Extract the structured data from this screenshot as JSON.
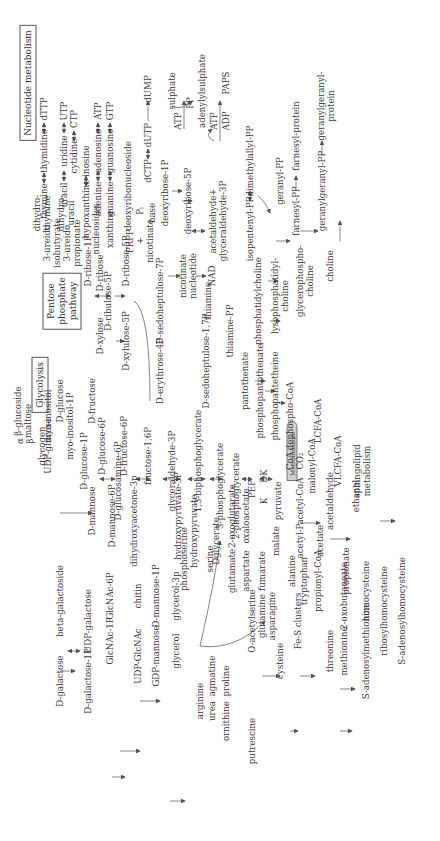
{
  "figure": {
    "orientation": "rotated-90-ccw",
    "section_titles": {
      "nucleotide": "Nucleotide metabolism",
      "pentose": "Pentose\nphosphate\npathway",
      "glycolysis": "Glycolysis"
    },
    "drug_label": "Metronidazole",
    "nodes": {
      "thymine": "thymine",
      "thymidine": "thymidine",
      "dTTP": "dTTP",
      "uracil": "uracil",
      "uridine": "uridine",
      "UTP": "UTP",
      "cytidine": "cytidine",
      "CTP": "CTP",
      "hypoxanthine": "hypoxanthine",
      "inosine": "inosine",
      "adenine": "adenine",
      "adenosine": "adenosine",
      "ATP1": "ATP",
      "guanine": "guanine",
      "guanosine": "guanosine",
      "GTP": "GTP",
      "deoxyribonucleoside": "deoxyribonucleoside",
      "dCTP": "dCTP",
      "dUTP": "dUTP",
      "dUMP": "dUMP",
      "sulphate": "sulphate",
      "ATP2": "ATP",
      "PP": "PP",
      "adenylylsulphate": "adenylylsulphate",
      "ATP3": "ATP",
      "ADP": "ADP",
      "PAPS": "PAPS",
      "Pi": "Pᵢ",
      "base": "base",
      "deoxyribose1P": "deoxyribose-1P",
      "deoxyribose5P": "deoxyribose-5P",
      "acetaldehyde_g3p": "acetaldehyde+\nglyceraldehyde-3P",
      "isopentenylPP": "isopentenyl-PP",
      "dimethylallylPP": "dimethylallyl-PP",
      "geranylPP": "geranyl-PP",
      "farnesylPP": "farnesyl-PP",
      "farnesylprotein": "farnesyl-protein",
      "geranylgeranylPP": "geranylgeranyl-PP",
      "geranylgeranylprotein": "geranylgeranyl-\nprotein",
      "ureidoisobutyrate": "3-ureido\nisobutyrate",
      "dihydrothymine": "dihydro-\nthymine",
      "ureidopropionate": "3-ureido\npropionate",
      "dihydrouracil": "dihydro-\nuracil",
      "nucleosides": "nucleosides",
      "xanthine": "xanthine",
      "PRPP_nicotinate": "PRPP\n+\nnicotinate",
      "nicotinate_nucleotide": "nicotinate\nnucleotide",
      "NAD": "NAD",
      "Dribose1P": "D-ribose-1P",
      "Dribose": "D-ribose",
      "Dribose5P": "D-ribose-5P",
      "Dribulose5P": "D-ribulose-5P",
      "Dxylose": "D-xylose",
      "Dxylulose5P": "D-xylulose-5P",
      "sedoheptulose7P": "D-sedoheptulose-7P",
      "erythrose4P": "D-erythrose-4P",
      "sedoheptulose17P": "D-sedoheptulose-1,7P",
      "thiamine": "thiamine",
      "thiaminePP": "thiamine-PP",
      "phosphatidylcholine": "phosphatidylcholine",
      "lysophosphatidylcholine": "lysophosphatidyl-\ncholine",
      "glycerophosphocholine": "glycerophospho-\ncholine",
      "choline": "choline",
      "pantothenate": "pantothenate",
      "phosphopantothenate": "phosphopantothenate",
      "phosphopantetheine": "phosphopantetheine",
      "dephosphoCoA": "dephospho-CoA",
      "CoA": "CoA",
      "CO2": "CO₂",
      "malonylCoA": "malonyl-CoA",
      "LCFACoA": "LCFA-CoA",
      "VLCFACoA": "VLCFA-CoA",
      "sphingolipid": "sphingolipid\nmetabolism",
      "beta_glucoside": "β-glucoside",
      "maltose": "maltose",
      "alpha": "α",
      "beta": "β",
      "glycogen": "glycogen",
      "Dglucose": "D-glucose",
      "myoinositol": "myo-inositol",
      "myoinositol1P": "myo-inositol-1P",
      "Dfructose": "D-fructose",
      "Dglucose6P": "D-glucose-6P",
      "Dfructose6P": "D-fructose-6P",
      "fructose16P": "fructose-1,6P",
      "glyceraldehyde3P": "glyceraldehyde-3P",
      "biphosphoglycerate": "1,3-biphosphoglycerate",
      "phosphoglycerate3": "3-phosphoglycerate",
      "phosphoglycerate2": "2-phosphoglycerate",
      "PEP": "PEP",
      "K": "K",
      "DK": "DK",
      "pyruvate": "pyruvate",
      "acetylCoA": "acetyl-CoA",
      "acetaldehyde": "acetaldehyde",
      "ethanol": "ethanol",
      "UDPglucose": "UDP-glucose",
      "Dglucose1P": "D-glucose-1P",
      "Dglucosamine6P": "D-glucosamine-6P",
      "Dmannose": "D-mannose",
      "Dmannose6P": "D-mannose-6P",
      "dihydroxyacetone3p": "dihydroxyacetone-3p",
      "hydroxypyruvate3P": "hydroxypyruvate-3P",
      "hydroxypyruvate": "hydroxypyruvate",
      "Dglycerate": "Dglycerate",
      "oxoglutarate": "2-oxoglutarate",
      "oxaloacetate": "oxaloacetate",
      "phosphoserine": "phosphoserine",
      "serine": "serine",
      "glutamate": "glutamate",
      "aspartate": "aspartate",
      "fumarate": "fumarate",
      "malate": "malate",
      "acetylP": "acetyl-P",
      "acetate": "acetate",
      "propionylCoA": "propionyl-CoA",
      "propionate": "propionate",
      "Dgalactose": "D-galactose",
      "betagalactoside": "beta-galactoside",
      "Dgalactose1P": "D-galactose-1P",
      "UDPgalactose": "UDP-galactose",
      "GlcNAc1P": "GlcNAc-1P",
      "GlcNAc6P": "GlcNAc-6P",
      "UDPGlcNAc": "UDP-GlcNAc",
      "chitin": "chitin",
      "GDPmannose": "GDP-mannose",
      "Dmannose1P": "D-mannose-1P",
      "glycerol": "glycerol",
      "glycerol3p": "glycerol-3p",
      "arginine": "arginine",
      "agmatine": "agmatine",
      "urea": "urea",
      "ornithine": "ornithine",
      "proline": "proline",
      "putrescine": "putrescine",
      "Oacetylserine": "O-acetylserine",
      "glutamine": "glutamine",
      "asparagine": "asparagine",
      "cysteine": "cysteine",
      "FeS": "Fe-S clusters",
      "alanine": "alanine",
      "tryptophan": "tryptophan",
      "threonine": "threonine",
      "methionine": "methionine",
      "oxobutanoate": "2-oxobutanoate",
      "SAM": "S-adenosylmethionine",
      "homocysteine": "homocysteine",
      "ribosylhomocysteine": "ribosylhomocysteine",
      "SAH": "S-adenosylhomocysteine"
    }
  }
}
